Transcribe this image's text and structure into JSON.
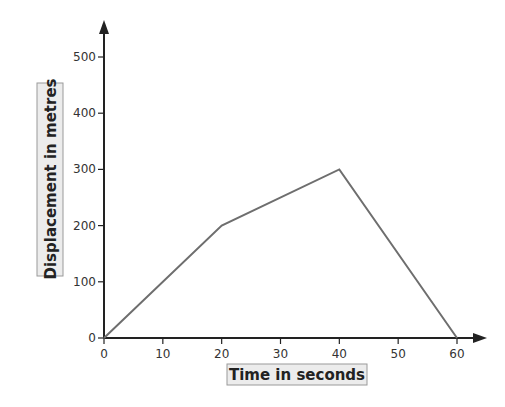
{
  "chart_data": {
    "type": "line",
    "title": "",
    "xlabel": "Time in seconds",
    "ylabel": "Displacement in metres",
    "x": [
      0,
      20,
      40,
      60
    ],
    "series": [
      {
        "name": "displacement",
        "values": [
          0,
          200,
          300,
          0
        ]
      }
    ],
    "xlim": [
      0,
      60
    ],
    "ylim": [
      0,
      500
    ],
    "xticks": [
      0,
      10,
      20,
      30,
      40,
      50,
      60
    ],
    "yticks": [
      0,
      100,
      200,
      300,
      400,
      500
    ],
    "grid": false,
    "legend": "none"
  },
  "colors": {
    "axis": "#222222",
    "line": "#6e6e6e",
    "label_box_fill": "#ececec",
    "label_box_border": "#9a9a9a"
  }
}
